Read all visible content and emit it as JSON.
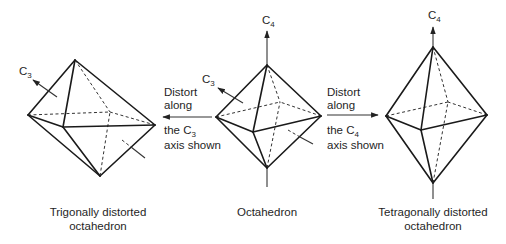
{
  "figure": {
    "shapes": [
      {
        "id": "trigonal",
        "caption_line1": "Trigonally distorted",
        "caption_line2": "octahedron",
        "axis_label": "C",
        "axis_subscript": "3"
      },
      {
        "id": "octahedron",
        "caption_line1": "Octahedron",
        "axis_c4_label": "C",
        "axis_c4_subscript": "4",
        "axis_c3_label": "C",
        "axis_c3_subscript": "3"
      },
      {
        "id": "tetragonal",
        "caption_line1": "Tetragonally distorted",
        "caption_line2": "octahedron",
        "axis_label": "C",
        "axis_subscript": "4"
      }
    ],
    "transitions": [
      {
        "direction": "left",
        "line1": "Distort",
        "line2": "along",
        "line3_prefix": "the C",
        "line3_subscript": "3",
        "line4": "axis shown"
      },
      {
        "direction": "right",
        "line1": "Distort",
        "line2": "along",
        "line3_prefix": "the C",
        "line3_subscript": "4",
        "line4": "axis shown"
      }
    ]
  }
}
